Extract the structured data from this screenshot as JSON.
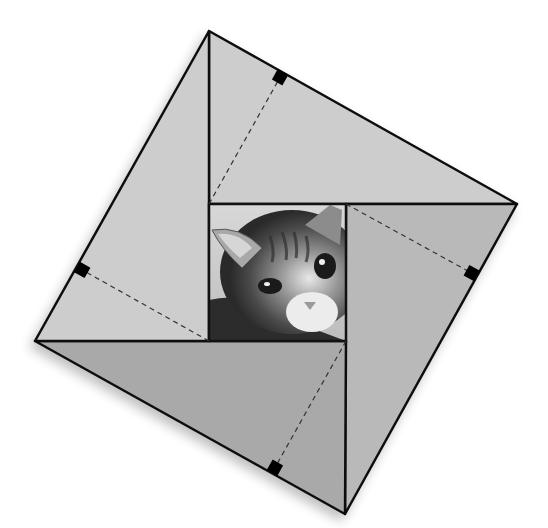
{
  "diagram": {
    "outer_square": {
      "vertices": [
        [
          209,
          31
        ],
        [
          517,
          204
        ],
        [
          345,
          514
        ],
        [
          35,
          341
        ]
      ]
    },
    "inner_square": {
      "x": 209,
      "y": 204,
      "width": 137,
      "height": 137,
      "content": "photo-cat"
    },
    "triangles": [
      {
        "name": "top",
        "points": [
          [
            209,
            31
          ],
          [
            517,
            204
          ],
          [
            209,
            204
          ]
        ],
        "fill": "#cdcdcd",
        "altitude_from": [
          209,
          204
        ],
        "altitude_foot": [
          283,
          72
        ]
      },
      {
        "name": "right",
        "points": [
          [
            517,
            204
          ],
          [
            345,
            514
          ],
          [
            346,
            204
          ]
        ],
        "fill": "#b9b9b9",
        "altitude_from": [
          346,
          204
        ],
        "altitude_foot": [
          477,
          276
        ]
      },
      {
        "name": "bottom",
        "points": [
          [
            345,
            514
          ],
          [
            35,
            341
          ],
          [
            346,
            341
          ]
        ],
        "fill": "#a9a9a9",
        "altitude_from": [
          346,
          341
        ],
        "altitude_foot": [
          272,
          473
        ]
      },
      {
        "name": "left",
        "points": [
          [
            35,
            341
          ],
          [
            209,
            31
          ],
          [
            209,
            341
          ]
        ],
        "fill": "#cdcdcd",
        "altitude_from": [
          209,
          341
        ],
        "altitude_foot": [
          77,
          267
        ]
      }
    ],
    "colors": {
      "stroke": "#111111",
      "marker": "#000000",
      "light_gray": "#cdcdcd",
      "mid_gray": "#b9b9b9",
      "dark_gray": "#a9a9a9"
    }
  }
}
